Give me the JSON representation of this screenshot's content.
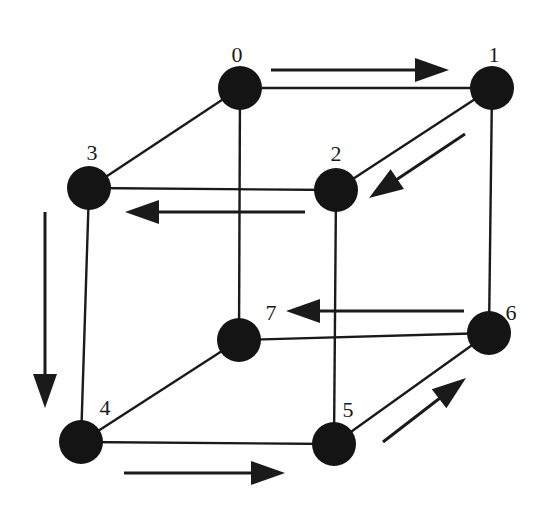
{
  "diagram": {
    "type": "hypercube-3d-gray-code-traversal",
    "colors": {
      "ink": "#1a1a1a",
      "node_fill": "#141414",
      "background": "#ffffff"
    },
    "node_radius": 22,
    "nodes": [
      {
        "id": "0",
        "label": "0",
        "x": 240,
        "y": 88,
        "lx": 237,
        "ly": 54
      },
      {
        "id": "1",
        "label": "1",
        "x": 492,
        "y": 88,
        "lx": 494,
        "ly": 54
      },
      {
        "id": "2",
        "label": "2",
        "x": 336,
        "y": 190,
        "lx": 336,
        "ly": 153
      },
      {
        "id": "3",
        "label": "3",
        "x": 89,
        "y": 188,
        "lx": 92,
        "ly": 152
      },
      {
        "id": "4",
        "label": "4",
        "x": 81,
        "y": 442,
        "lx": 105,
        "ly": 407
      },
      {
        "id": "5",
        "label": "5",
        "x": 334,
        "y": 444,
        "lx": 348,
        "ly": 409
      },
      {
        "id": "6",
        "label": "6",
        "x": 489,
        "y": 333,
        "lx": 511,
        "ly": 312
      },
      {
        "id": "7",
        "label": "7",
        "x": 239,
        "y": 340,
        "lx": 271,
        "ly": 312
      }
    ],
    "edges": [
      [
        "0",
        "1"
      ],
      [
        "0",
        "3"
      ],
      [
        "0",
        "7"
      ],
      [
        "1",
        "2"
      ],
      [
        "1",
        "6"
      ],
      [
        "2",
        "3"
      ],
      [
        "2",
        "5"
      ],
      [
        "3",
        "4"
      ],
      [
        "4",
        "5"
      ],
      [
        "4",
        "7"
      ],
      [
        "5",
        "6"
      ],
      [
        "6",
        "7"
      ]
    ],
    "traversal_arrows": [
      {
        "from": "0",
        "to": "1",
        "x1": 271,
        "y1": 70,
        "x2": 449,
        "y2": 70
      },
      {
        "from": "1",
        "to": "2",
        "x1": 465,
        "y1": 134,
        "x2": 369,
        "y2": 198
      },
      {
        "from": "2",
        "to": "3",
        "x1": 305,
        "y1": 212,
        "x2": 125,
        "y2": 212
      },
      {
        "from": "3",
        "to": "4",
        "x1": 45,
        "y1": 212,
        "x2": 45,
        "y2": 408
      },
      {
        "from": "4",
        "to": "5",
        "x1": 124,
        "y1": 473,
        "x2": 285,
        "y2": 473
      },
      {
        "from": "5",
        "to": "6",
        "x1": 383,
        "y1": 442,
        "x2": 466,
        "y2": 378
      },
      {
        "from": "6",
        "to": "7",
        "x1": 464,
        "y1": 311,
        "x2": 286,
        "y2": 311
      }
    ]
  }
}
